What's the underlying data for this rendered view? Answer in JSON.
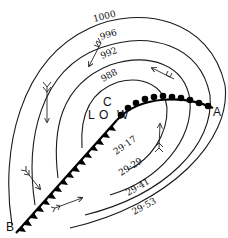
{
  "diagram": {
    "type": "weather-map-depression",
    "center_label": {
      "letters": [
        "L",
        "O",
        "C",
        "W"
      ],
      "text": "LOW"
    },
    "points": {
      "warm_front_end": "A",
      "cold_front_end": "B"
    },
    "isobars_mb": [
      "1000",
      "996",
      "992",
      "988"
    ],
    "isobars_inhg": [
      "29·17",
      "29·29",
      "29·41",
      "29·53"
    ],
    "fronts": [
      {
        "name": "warm front",
        "symbol": "semicircles",
        "from": "LOW",
        "to": "A"
      },
      {
        "name": "cold front",
        "symbol": "triangles",
        "from": "LOW",
        "to": "B"
      }
    ],
    "wind_arrows": 6,
    "colors": {
      "ink": "#111111",
      "background": "#ffffff"
    }
  }
}
